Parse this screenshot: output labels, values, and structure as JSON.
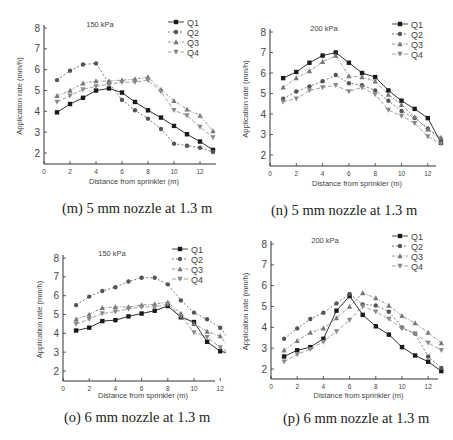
{
  "figure": {
    "captions": [
      "(m) 5 mm nozzle at 1.3 m",
      "(n) 5 mm nozzle at 1.3 m",
      "(o) 6 mm nozzle at 1.3 m",
      "(p) 6 mm nozzle at 1.3 m"
    ]
  },
  "style": {
    "series_colors": {
      "Q1": "#1a1a1a",
      "Q2": "#555555",
      "Q3": "#777777",
      "Q4": "#888888"
    },
    "series_dash": {
      "Q1": "",
      "Q2": "2,2",
      "Q3": "3,1.5,1,1.5",
      "Q4": "4,2"
    },
    "series_markers": {
      "Q1": "square",
      "Q2": "circle",
      "Q3": "triangle-up",
      "Q4": "triangle-down"
    }
  },
  "chart_data": [
    {
      "type": "line",
      "panel": "m",
      "title": "150 kPa",
      "caption": "(m) 5 mm nozzle at 1.3 m",
      "xlabel": "Distance from sprinkler (m)",
      "ylabel": "Application rate (mm/h)",
      "xlim": [
        0,
        13
      ],
      "ylim": [
        1.5,
        8
      ],
      "xticks": [
        0,
        2,
        4,
        6,
        8,
        10,
        12
      ],
      "yticks": [
        2,
        3,
        4,
        5,
        6,
        7,
        8
      ],
      "legend_position": "upper right",
      "x": [
        1,
        2,
        3,
        4,
        5,
        6,
        7,
        8,
        9,
        10,
        11,
        12,
        13
      ],
      "series": [
        {
          "name": "Q1",
          "values": [
            3.95,
            4.35,
            4.65,
            5.0,
            5.1,
            4.9,
            4.45,
            4.05,
            3.7,
            3.3,
            2.9,
            2.55,
            2.15
          ]
        },
        {
          "name": "Q2",
          "values": [
            5.5,
            5.95,
            6.25,
            6.3,
            5.35,
            4.55,
            4.05,
            3.65,
            3.15,
            2.45,
            2.35,
            2.25,
            2.05
          ]
        },
        {
          "name": "Q3",
          "values": [
            4.75,
            5.0,
            5.35,
            5.45,
            5.45,
            5.5,
            5.55,
            5.65,
            5.05,
            4.5,
            4.1,
            3.8,
            3.05
          ]
        },
        {
          "name": "Q4",
          "values": [
            4.45,
            4.75,
            5.05,
            5.2,
            5.3,
            5.4,
            5.4,
            5.5,
            4.95,
            4.05,
            3.8,
            3.25,
            2.75
          ]
        }
      ]
    },
    {
      "type": "line",
      "panel": "n",
      "title": "200 kPa",
      "caption": "(n) 5 mm nozzle at 1.3 m",
      "xlabel": "Distance from sprinkler (m)",
      "ylabel": "Application rate (mm/h)",
      "xlim": [
        0,
        13
      ],
      "ylim": [
        1.5,
        8
      ],
      "xticks": [
        0,
        2,
        4,
        6,
        8,
        10,
        12
      ],
      "yticks": [
        2,
        3,
        4,
        5,
        6,
        7,
        8
      ],
      "legend_position": "upper right",
      "x": [
        1,
        2,
        3,
        4,
        5,
        6,
        7,
        8,
        9,
        10,
        11,
        12,
        13
      ],
      "series": [
        {
          "name": "Q1",
          "values": [
            5.75,
            6.05,
            6.5,
            6.85,
            7.0,
            6.5,
            6.0,
            5.8,
            5.15,
            4.65,
            4.25,
            3.8,
            2.6
          ]
        },
        {
          "name": "Q2",
          "values": [
            4.75,
            5.1,
            5.35,
            5.6,
            5.9,
            5.5,
            5.4,
            5.15,
            4.65,
            4.15,
            3.8,
            3.3,
            2.75
          ]
        },
        {
          "name": "Q3",
          "values": [
            5.3,
            5.75,
            6.1,
            6.55,
            6.85,
            5.85,
            5.8,
            5.6,
            4.95,
            4.45,
            3.85,
            3.25,
            2.85
          ]
        },
        {
          "name": "Q4",
          "values": [
            4.6,
            4.75,
            5.15,
            5.3,
            5.4,
            5.1,
            5.3,
            4.95,
            4.2,
            3.9,
            3.55,
            2.9,
            2.55
          ]
        }
      ]
    },
    {
      "type": "line",
      "panel": "o",
      "title": "150 kPa",
      "caption": "(o) 6 mm nozzle at 1.3 m",
      "xlabel": "Distance from sprinkler (m)",
      "ylabel": "Application rate (mm/h)",
      "xlim": [
        0,
        13
      ],
      "ylim": [
        1.5,
        8
      ],
      "xticks": [
        0,
        2,
        4,
        6,
        8,
        10,
        12
      ],
      "yticks": [
        2,
        3,
        4,
        5,
        6,
        7,
        8
      ],
      "legend_position": "upper right",
      "x": [
        1,
        2,
        3,
        4,
        5,
        6,
        7,
        8,
        9,
        10,
        11,
        12,
        13
      ],
      "series": [
        {
          "name": "Q1",
          "values": [
            4.15,
            4.3,
            4.65,
            4.7,
            4.9,
            5.05,
            5.2,
            5.45,
            4.85,
            4.6,
            3.55,
            3.05,
            2.9
          ]
        },
        {
          "name": "Q2",
          "values": [
            5.5,
            5.95,
            6.25,
            6.45,
            6.75,
            6.95,
            6.95,
            6.6,
            5.75,
            5.1,
            4.75,
            4.3,
            3.35
          ]
        },
        {
          "name": "Q3",
          "values": [
            4.75,
            5.0,
            5.35,
            5.4,
            5.4,
            5.5,
            5.55,
            5.65,
            5.05,
            4.5,
            4.1,
            3.85,
            2.95
          ]
        },
        {
          "name": "Q4",
          "values": [
            4.5,
            4.75,
            5.05,
            5.15,
            5.3,
            5.4,
            5.4,
            5.55,
            4.9,
            4.05,
            3.8,
            3.25,
            2.85
          ]
        }
      ]
    },
    {
      "type": "line",
      "panel": "p",
      "title": "200 kPa",
      "caption": "(p) 6 mm nozzle at 1.3 m",
      "xlabel": "Distance from sprinkler (m)",
      "ylabel": "Application rate (mm/h)",
      "xlim": [
        0,
        13
      ],
      "ylim": [
        1.5,
        8
      ],
      "xticks": [
        0,
        2,
        4,
        6,
        8,
        10,
        12
      ],
      "yticks": [
        2,
        3,
        4,
        5,
        6,
        7,
        8
      ],
      "legend_position": "upper right",
      "x": [
        1,
        2,
        3,
        4,
        5,
        6,
        7,
        8,
        9,
        10,
        11,
        12,
        13
      ],
      "series": [
        {
          "name": "Q1",
          "values": [
            2.6,
            2.9,
            3.05,
            3.45,
            4.8,
            5.5,
            4.6,
            4.05,
            3.65,
            3.05,
            2.65,
            2.35,
            1.9
          ]
        },
        {
          "name": "Q2",
          "values": [
            3.45,
            3.95,
            4.4,
            4.7,
            5.15,
            5.6,
            5.1,
            5.05,
            4.75,
            4.0,
            3.7,
            2.6,
            2.05
          ]
        },
        {
          "name": "Q3",
          "values": [
            2.9,
            3.35,
            3.75,
            3.95,
            4.45,
            5.0,
            5.65,
            5.4,
            5.05,
            4.55,
            4.2,
            3.75,
            3.25
          ]
        },
        {
          "name": "Q4",
          "values": [
            2.35,
            2.7,
            2.95,
            3.3,
            3.8,
            4.35,
            5.0,
            4.75,
            4.4,
            3.95,
            3.7,
            3.25,
            2.9
          ]
        }
      ]
    }
  ]
}
